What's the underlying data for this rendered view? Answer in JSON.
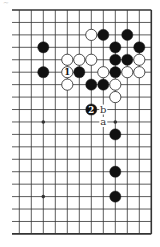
{
  "diagram": {
    "type": "go-board-fragment",
    "corner_mark": "~",
    "grid": {
      "columns": 12,
      "rows": 19,
      "origin_x": 19.3,
      "origin_y": 10,
      "spacing_x": 12,
      "spacing_y": 12.44,
      "open_left": true,
      "edges": [
        "top",
        "right",
        "bottom"
      ],
      "line_color": "#333333",
      "edge_width": 1.6,
      "line_width": 0.8
    },
    "hoshi": [
      [
        2,
        3
      ],
      [
        8,
        3
      ],
      [
        2,
        9
      ],
      [
        8,
        9
      ],
      [
        2,
        15
      ],
      [
        8,
        15
      ]
    ],
    "stones": [
      {
        "color": "white",
        "col": 6,
        "row": 2
      },
      {
        "color": "black",
        "col": 7,
        "row": 2
      },
      {
        "color": "black",
        "col": 9,
        "row": 2
      },
      {
        "color": "black",
        "col": 2,
        "row": 3
      },
      {
        "color": "black",
        "col": 8,
        "row": 3
      },
      {
        "color": "black",
        "col": 10,
        "row": 3
      },
      {
        "color": "white",
        "col": 4,
        "row": 4
      },
      {
        "color": "white",
        "col": 5,
        "row": 4
      },
      {
        "color": "white",
        "col": 6,
        "row": 4
      },
      {
        "color": "black",
        "col": 8,
        "row": 4
      },
      {
        "color": "black",
        "col": 9,
        "row": 4
      },
      {
        "color": "white",
        "col": 10,
        "row": 4
      },
      {
        "color": "black",
        "col": 2,
        "row": 5
      },
      {
        "color": "white",
        "col": 4,
        "row": 5,
        "label": "1"
      },
      {
        "color": "black",
        "col": 5,
        "row": 5
      },
      {
        "color": "white",
        "col": 7,
        "row": 5
      },
      {
        "color": "black",
        "col": 8,
        "row": 5
      },
      {
        "color": "white",
        "col": 9,
        "row": 5
      },
      {
        "color": "white",
        "col": 10,
        "row": 5
      },
      {
        "color": "white",
        "col": 4,
        "row": 6
      },
      {
        "color": "black",
        "col": 6,
        "row": 6
      },
      {
        "color": "black",
        "col": 7,
        "row": 6
      },
      {
        "color": "white",
        "col": 8,
        "row": 6
      },
      {
        "color": "white",
        "col": 8,
        "row": 7
      },
      {
        "color": "black",
        "col": 6,
        "row": 8,
        "label": "2"
      },
      {
        "color": "black",
        "col": 8,
        "row": 10
      },
      {
        "color": "black",
        "col": 8,
        "row": 13
      },
      {
        "color": "black",
        "col": 8,
        "row": 15
      }
    ],
    "point_labels": [
      {
        "text": "b",
        "col": 7,
        "row": 8
      },
      {
        "text": "a",
        "col": 7,
        "row": 9
      }
    ],
    "colors": {
      "black_stone": "#111111",
      "white_stone": "#ffffff",
      "stone_outline": "#222222",
      "label_on_black": "#ffffff",
      "label_on_white": "#111111",
      "background": "#ffffff"
    }
  }
}
